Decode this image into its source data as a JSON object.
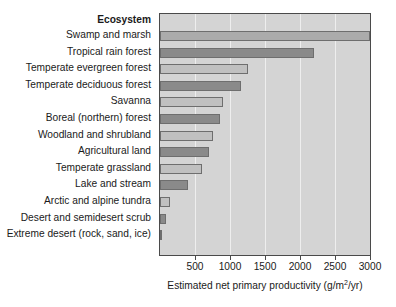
{
  "chart_data": {
    "type": "bar",
    "orientation": "horizontal",
    "title": "",
    "header_label": "Ecosystem",
    "xlabel": "Estimated net primary productivity (g/m2/yr)",
    "xlabel_prefix": "Estimated net primary productivity (g/m",
    "xlabel_superscript": "2",
    "xlabel_suffix": "/yr)",
    "ylabel": "",
    "xlim": [
      0,
      3000
    ],
    "xticks": [
      500,
      1000,
      1500,
      2000,
      2500,
      3000
    ],
    "xtick_labels": [
      "500",
      "1000",
      "1500",
      "2000",
      "2500",
      "3000"
    ],
    "grid": true,
    "legend": "none",
    "plot_background": "#d4d4d4",
    "bar_color_light": "#c0c0c0",
    "bar_color_dark": "#8a8a8a",
    "categories": [
      "Swamp and marsh",
      "Tropical rain forest",
      "Temperate evergreen forest",
      "Temperate deciduous forest",
      "Savanna",
      "Boreal (northern) forest",
      "Woodland and shrubland",
      "Agricultural land",
      "Temperate grassland",
      "Lake and stream",
      "Arctic and alpine tundra",
      "Desert and semidesert scrub",
      "Extreme desert (rock, sand, ice)"
    ],
    "values": [
      3000,
      2200,
      1250,
      1150,
      900,
      850,
      750,
      700,
      600,
      400,
      140,
      80,
      20
    ],
    "shades": [
      "mid",
      "dark",
      "light",
      "dark",
      "light",
      "dark",
      "light",
      "dark",
      "light",
      "dark",
      "light",
      "dark",
      "light"
    ]
  }
}
